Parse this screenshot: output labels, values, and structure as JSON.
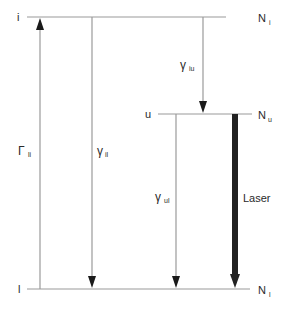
{
  "diagram": {
    "type": "energy-level-diagram",
    "levels": [
      {
        "id": "i",
        "label": "i",
        "population_label": "N",
        "population_sub": "i"
      },
      {
        "id": "u",
        "label": "u",
        "population_label": "N",
        "population_sub": "u"
      },
      {
        "id": "l",
        "label": "l",
        "population_label": "N",
        "population_sub": "l"
      }
    ],
    "transitions": [
      {
        "id": "Gamma_li",
        "symbol": "Γ",
        "sub": "li",
        "from": "l",
        "to": "i",
        "direction": "up"
      },
      {
        "id": "gamma_il",
        "symbol": "γ",
        "sub": "il",
        "from": "i",
        "to": "l",
        "direction": "down"
      },
      {
        "id": "gamma_iu",
        "symbol": "γ",
        "sub": "iu",
        "from": "i",
        "to": "u",
        "direction": "down"
      },
      {
        "id": "gamma_ul",
        "symbol": "γ",
        "sub": "ul",
        "from": "u",
        "to": "l",
        "direction": "down"
      },
      {
        "id": "laser",
        "label": "Laser",
        "from": "u",
        "to": "l",
        "direction": "down",
        "style": "thick"
      }
    ],
    "colors": {
      "line": "#9a9a9a",
      "arrow": "#1a1a1a",
      "laser": "#222222",
      "text": "#2a2a2a"
    }
  }
}
